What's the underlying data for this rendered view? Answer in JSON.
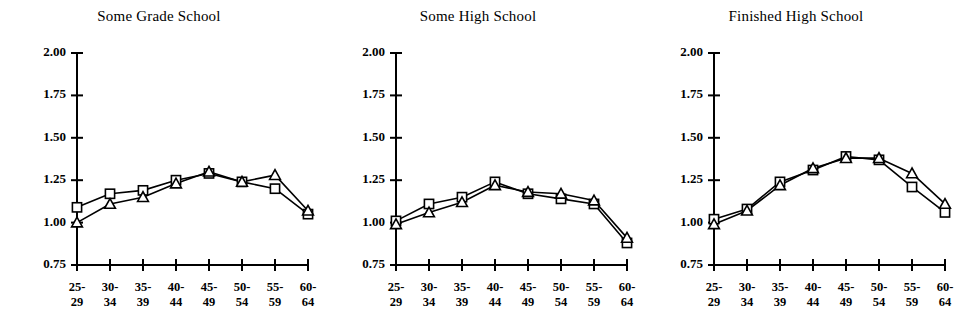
{
  "figure": {
    "background": "#ffffff",
    "ink": "#000000"
  },
  "chart_data": [
    {
      "type": "line",
      "title": "Some Grade School",
      "xlabel": "",
      "ylabel": "",
      "categories": [
        "25-29",
        "30-34",
        "35-39",
        "40-44",
        "45-49",
        "50-54",
        "55-59",
        "60-64"
      ],
      "ylim": [
        0.75,
        2.0
      ],
      "yticks": [
        "2.00",
        "1.75",
        "1.50",
        "1.25",
        "1.00",
        "0.75"
      ],
      "ytick_values": [
        2.0,
        1.75,
        1.5,
        1.25,
        1.0,
        0.75
      ],
      "grid": false,
      "legend": "none",
      "series": [
        {
          "name": "square-series",
          "marker": "square",
          "values": [
            1.09,
            1.17,
            1.19,
            1.25,
            1.29,
            1.24,
            1.2,
            1.05
          ]
        },
        {
          "name": "triangle-series",
          "marker": "triangle",
          "values": [
            1.0,
            1.11,
            1.15,
            1.23,
            1.3,
            1.24,
            1.28,
            1.07
          ]
        }
      ]
    },
    {
      "type": "line",
      "title": "Some High School",
      "xlabel": "",
      "ylabel": "",
      "categories": [
        "25-29",
        "30-34",
        "35-39",
        "40-44",
        "45-49",
        "50-54",
        "55-59",
        "60-64"
      ],
      "ylim": [
        0.75,
        2.0
      ],
      "yticks": [
        "2.00",
        "1.75",
        "1.50",
        "1.25",
        "1.00",
        "0.75"
      ],
      "ytick_values": [
        2.0,
        1.75,
        1.5,
        1.25,
        1.0,
        0.75
      ],
      "grid": false,
      "legend": "none",
      "series": [
        {
          "name": "square-series",
          "marker": "square",
          "values": [
            1.01,
            1.11,
            1.15,
            1.24,
            1.17,
            1.14,
            1.11,
            0.88
          ]
        },
        {
          "name": "triangle-series",
          "marker": "triangle",
          "values": [
            0.99,
            1.06,
            1.12,
            1.22,
            1.18,
            1.17,
            1.13,
            0.91
          ]
        }
      ]
    },
    {
      "type": "line",
      "title": "Finished High School",
      "xlabel": "",
      "ylabel": "",
      "categories": [
        "25-29",
        "30-34",
        "35-39",
        "40-44",
        "45-49",
        "50-54",
        "55-59",
        "60-64"
      ],
      "ylim": [
        0.75,
        2.0
      ],
      "yticks": [
        "2.00",
        "1.75",
        "1.50",
        "1.25",
        "1.00",
        "0.75"
      ],
      "ytick_values": [
        2.0,
        1.75,
        1.5,
        1.25,
        1.0,
        0.75
      ],
      "grid": false,
      "legend": "none",
      "series": [
        {
          "name": "square-series",
          "marker": "square",
          "values": [
            1.02,
            1.08,
            1.24,
            1.31,
            1.39,
            1.37,
            1.21,
            1.06
          ]
        },
        {
          "name": "triangle-series",
          "marker": "triangle",
          "values": [
            0.99,
            1.07,
            1.22,
            1.32,
            1.38,
            1.38,
            1.29,
            1.11
          ]
        }
      ]
    }
  ]
}
